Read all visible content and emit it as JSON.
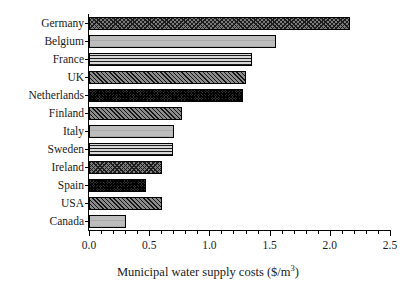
{
  "chart_data": {
    "type": "bar",
    "orientation": "horizontal",
    "title": "",
    "xlabel": "Municipal water supply costs ($/m3)",
    "xlabel_prefix": "Municipal water supply costs ($/m",
    "xlabel_superscript": "3",
    "xlabel_suffix": ")",
    "ylabel": "",
    "categories": [
      "Germany",
      "Belgium",
      "France",
      "UK",
      "Netherlands",
      "Finland",
      "Italy",
      "Sweden",
      "Ireland",
      "Spain",
      "USA",
      "Canada"
    ],
    "values": [
      2.17,
      1.55,
      1.35,
      1.3,
      1.28,
      0.77,
      0.71,
      0.7,
      0.61,
      0.47,
      0.61,
      0.31
    ],
    "xlim": [
      0.0,
      2.5
    ],
    "xticks": [
      0.0,
      0.5,
      1.0,
      1.5,
      2.0,
      2.5
    ],
    "xtick_labels": [
      "0.0",
      "0.5",
      "1.0",
      "1.5",
      "2.0",
      "2.5"
    ],
    "xtick_minor_step": 0.1,
    "grid": false,
    "legend": null,
    "bar_patterns": [
      "crosshatch-dark",
      "light-gray",
      "horizontal-lines",
      "diagonal-hatch",
      "dense-dark",
      "diagonal-hatch",
      "light-gray",
      "horizontal-lines",
      "crosshatch-dark",
      "dense-dark",
      "diagonal-hatch",
      "light-gray"
    ],
    "colors": {
      "axis": "#000000",
      "text": "#1a1a1a",
      "background": "#ffffff",
      "bar_edge": "#000000"
    }
  }
}
